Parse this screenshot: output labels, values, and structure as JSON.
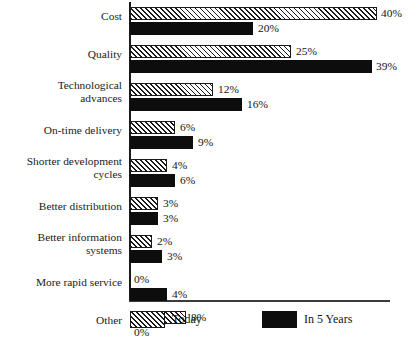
{
  "chart_data": {
    "type": "bar",
    "orientation": "horizontal",
    "title": "",
    "xlabel": "",
    "ylabel": "",
    "grid": false,
    "legend_position": "bottom",
    "value_suffix": "%",
    "categories": [
      "Cost",
      "Quality",
      "Technological advances",
      "On-time delivery",
      "Shorter development cycles",
      "Better distribution",
      "Better information systems",
      "More rapid service",
      "Other"
    ],
    "series": [
      {
        "name": "Today",
        "style": "hatched",
        "values": [
          40,
          25,
          12,
          6,
          4,
          3,
          2,
          0,
          8
        ]
      },
      {
        "name": "In 5 Years",
        "style": "solid-black",
        "values": [
          20,
          39,
          16,
          9,
          6,
          3,
          3,
          4,
          0
        ]
      }
    ]
  },
  "rows": [
    {
      "label": "Cost",
      "label_top": 10,
      "today": {
        "text": "40%",
        "bar_px": 247,
        "label_x": 381,
        "label_y": 7
      },
      "future": {
        "text": "20%",
        "bar_px": 123,
        "label_x": 258,
        "label_y": 22
      }
    },
    {
      "label": "Quality",
      "label_top": 48,
      "today": {
        "text": "25%",
        "bar_px": 161,
        "label_x": 296,
        "label_y": 45
      },
      "future": {
        "text": "39%",
        "bar_px": 242,
        "label_x": 376,
        "label_y": 60
      }
    },
    {
      "label": "Technological\nadvances",
      "label_top": 79,
      "today": {
        "text": "12%",
        "bar_px": 83,
        "label_x": 218,
        "label_y": 83
      },
      "future": {
        "text": "16%",
        "bar_px": 112,
        "label_x": 247,
        "label_y": 98
      }
    },
    {
      "label": "On-time delivery",
      "label_top": 124,
      "today": {
        "text": "6%",
        "bar_px": 45,
        "label_x": 180,
        "label_y": 121
      },
      "future": {
        "text": "9%",
        "bar_px": 63,
        "label_x": 198,
        "label_y": 136
      }
    },
    {
      "label": "Shorter development\ncycles",
      "label_top": 155,
      "today": {
        "text": "4%",
        "bar_px": 37,
        "label_x": 172,
        "label_y": 159
      },
      "future": {
        "text": "6%",
        "bar_px": 45,
        "label_x": 180,
        "label_y": 174
      }
    },
    {
      "label": "Better distribution",
      "label_top": 200,
      "today": {
        "text": "3%",
        "bar_px": 28,
        "label_x": 163,
        "label_y": 197
      },
      "future": {
        "text": "3%",
        "bar_px": 28,
        "label_x": 163,
        "label_y": 212
      }
    },
    {
      "label": "Better information\nsystems",
      "label_top": 231,
      "today": {
        "text": "2%",
        "bar_px": 22,
        "label_x": 157,
        "label_y": 235
      },
      "future": {
        "text": "3%",
        "bar_px": 32,
        "label_x": 167,
        "label_y": 250
      }
    },
    {
      "label": "More rapid service",
      "label_top": 276,
      "today": {
        "text": "0%",
        "bar_px": 0,
        "label_x": 134,
        "label_y": 273
      },
      "future": {
        "text": "4%",
        "bar_px": 37,
        "label_x": 172,
        "label_y": 288
      }
    },
    {
      "label": "Other",
      "label_top": 314,
      "today": {
        "text": "8%",
        "bar_px": 56,
        "label_x": 191,
        "label_y": 311
      },
      "future": {
        "text": "0%",
        "bar_px": 0,
        "label_x": 134,
        "label_y": 326
      }
    }
  ],
  "legend": {
    "today": {
      "label": "Today",
      "swatch_x": 130,
      "text_x": 172
    },
    "future": {
      "label": "In 5 Years",
      "swatch_x": 262,
      "text_x": 304
    },
    "row_y": 311
  }
}
